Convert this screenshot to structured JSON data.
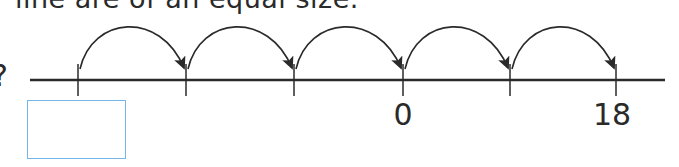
{
  "question_text": "line are of an equal size.",
  "question_mark": "?",
  "number_line": {
    "line_color": "#2a2a2a",
    "line_start_x": 30,
    "line_end_x": 665,
    "line_y": 80,
    "ticks": [
      {
        "x": 78,
        "label": ""
      },
      {
        "x": 186,
        "label": ""
      },
      {
        "x": 294,
        "label": ""
      },
      {
        "x": 403,
        "label": "0"
      },
      {
        "x": 510,
        "label": ""
      },
      {
        "x": 616,
        "label": "18"
      }
    ],
    "jumps": 5,
    "answer_box": {
      "value": "",
      "border_color": "#74b6ea"
    }
  },
  "labels": {
    "zero": "0",
    "eighteen": "18"
  }
}
